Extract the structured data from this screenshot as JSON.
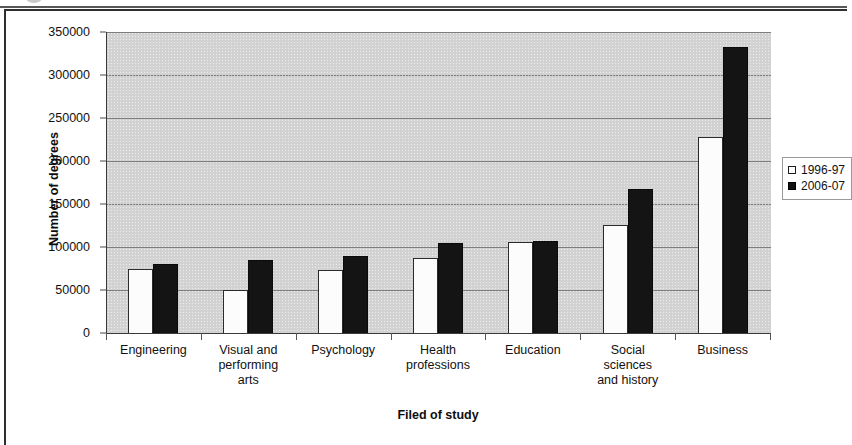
{
  "chart_data": {
    "type": "bar",
    "title": "",
    "xlabel": "Filed of study",
    "ylabel": "Number of degrees",
    "ylim": [
      0,
      350000
    ],
    "ytick_step": 50000,
    "yticks": [
      "350000",
      "300000",
      "250000",
      "200000",
      "150000",
      "100000",
      "50000",
      "0"
    ],
    "ytick_values": [
      350000,
      300000,
      250000,
      200000,
      150000,
      100000,
      50000,
      0
    ],
    "grid": true,
    "legend_position": "right",
    "plot_background": "#d2d2d2",
    "categories": [
      "Engineering",
      "Visual and performing arts",
      "Psychology",
      "Health professions",
      "Education",
      "Social sciences and history",
      "Business"
    ],
    "category_lines": [
      [
        "Engineering"
      ],
      [
        "Visual and",
        "performing",
        "arts"
      ],
      [
        "Psychology"
      ],
      [
        "Health",
        "professions"
      ],
      [
        "Education"
      ],
      [
        "Social",
        "sciences",
        "and history"
      ],
      [
        "Business"
      ]
    ],
    "series": [
      {
        "name": "1996-97",
        "color": "#ffffff",
        "values": [
          74000,
          50000,
          73000,
          87000,
          106000,
          126000,
          228000
        ]
      },
      {
        "name": "2006-07",
        "color": "#111111",
        "values": [
          80000,
          85000,
          90000,
          105000,
          107000,
          167000,
          332000
        ]
      }
    ]
  },
  "legend": {
    "items": [
      {
        "label": "1996-97",
        "swatch": "hollow-square-icon"
      },
      {
        "label": "2006-07",
        "swatch": "filled-square-icon"
      }
    ]
  }
}
